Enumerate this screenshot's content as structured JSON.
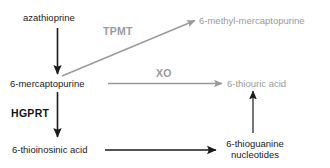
{
  "diagram": {
    "colors": {
      "dark": "#1a1a1a",
      "gray": "#9a9a9a",
      "background": "#ffffff"
    },
    "nodes": [
      {
        "id": "azathioprine",
        "label": "azathioprine",
        "tone": "dark"
      },
      {
        "id": "6-mercaptopurine",
        "label": "6-mercaptopurine",
        "tone": "dark"
      },
      {
        "id": "6-methyl-mercaptopurine",
        "label": "6-methyl-mercaptopurine",
        "tone": "gray"
      },
      {
        "id": "6-thiouric-acid",
        "label": "6-thiouric acid",
        "tone": "gray"
      },
      {
        "id": "6-thioinosinic-acid",
        "label": "6-thioinosinic acid",
        "tone": "dark"
      },
      {
        "id": "6-thioguanine-nucleotides-line1",
        "label": "6-thioguanine",
        "tone": "dark"
      },
      {
        "id": "6-thioguanine-nucleotides-line2",
        "label": "nucleotides",
        "tone": "dark"
      }
    ],
    "enzymes": [
      {
        "id": "TPMT",
        "label": "TPMT",
        "tone": "gray"
      },
      {
        "id": "XO",
        "label": "XO",
        "tone": "gray"
      },
      {
        "id": "HGPRT",
        "label": "HGPRT",
        "tone": "dark"
      }
    ],
    "edges": [
      {
        "id": "azathioprine-to-6-mercaptopurine",
        "from": "azathioprine",
        "to": "6-mercaptopurine",
        "tone": "dark",
        "enzyme": ""
      },
      {
        "id": "6-mercaptopurine-to-6-methyl-mercaptopurine",
        "from": "6-mercaptopurine",
        "to": "6-methyl-mercaptopurine",
        "tone": "gray",
        "enzyme": "TPMT"
      },
      {
        "id": "6-mercaptopurine-to-6-thiouric-acid",
        "from": "6-mercaptopurine",
        "to": "6-thiouric acid",
        "tone": "gray",
        "enzyme": "XO"
      },
      {
        "id": "6-mercaptopurine-to-6-thioinosinic-acid",
        "from": "6-mercaptopurine",
        "to": "6-thioinosinic acid",
        "tone": "dark",
        "enzyme": "HGPRT"
      },
      {
        "id": "6-thioinosinic-acid-to-6-thioguanine-nucleotides",
        "from": "6-thioinosinic acid",
        "to": "6-thioguanine nucleotides",
        "tone": "dark",
        "enzyme": ""
      },
      {
        "id": "6-thioguanine-nucleotides-to-6-thiouric-acid",
        "from": "6-thioguanine nucleotides",
        "to": "6-thiouric acid",
        "tone": "dark",
        "enzyme": ""
      }
    ]
  }
}
